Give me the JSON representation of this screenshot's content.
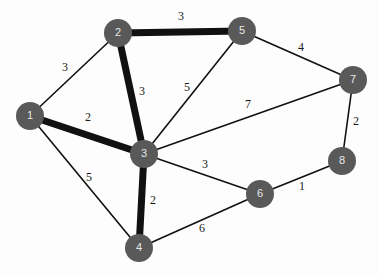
{
  "figure": {
    "background_color": "#fdfdfd",
    "width": 378,
    "height": 275
  },
  "style": {
    "node_fill": "#595959",
    "node_label_color": "#e8e8e8",
    "edge_color": "#111111",
    "weight_label_color": "#1a1a1a",
    "node_radius": 14
  },
  "chart_data": {
    "type": "diagram",
    "diagram_kind": "weighted-undirected-graph",
    "title": "",
    "nodes": [
      {
        "id": "1",
        "label": "1",
        "x": 30,
        "y": 116
      },
      {
        "id": "2",
        "label": "2",
        "x": 118,
        "y": 33
      },
      {
        "id": "3",
        "label": "3",
        "x": 144,
        "y": 154
      },
      {
        "id": "4",
        "label": "4",
        "x": 139,
        "y": 248
      },
      {
        "id": "5",
        "label": "5",
        "x": 242,
        "y": 31
      },
      {
        "id": "6",
        "label": "6",
        "x": 260,
        "y": 194
      },
      {
        "id": "7",
        "label": "7",
        "x": 353,
        "y": 80
      },
      {
        "id": "8",
        "label": "8",
        "x": 342,
        "y": 161
      }
    ],
    "edges": [
      {
        "source": "1",
        "target": "2",
        "weight": 3,
        "label": "3",
        "thick": false,
        "label_x": 65,
        "label_y": 68
      },
      {
        "source": "1",
        "target": "3",
        "weight": 2,
        "label": "2",
        "thick": true,
        "label_x": 88,
        "label_y": 118
      },
      {
        "source": "1",
        "target": "4",
        "weight": 5,
        "label": "5",
        "thick": false,
        "label_x": 89,
        "label_y": 178
      },
      {
        "source": "2",
        "target": "3",
        "weight": 3,
        "label": "3",
        "thick": true,
        "label_x": 142,
        "label_y": 92
      },
      {
        "source": "2",
        "target": "5",
        "weight": 3,
        "label": "3",
        "thick": true,
        "label_x": 181,
        "label_y": 17
      },
      {
        "source": "3",
        "target": "4",
        "weight": 2,
        "label": "2",
        "thick": true,
        "label_x": 153,
        "label_y": 201
      },
      {
        "source": "3",
        "target": "5",
        "weight": 5,
        "label": "5",
        "thick": false,
        "label_x": 187,
        "label_y": 88
      },
      {
        "source": "3",
        "target": "6",
        "weight": 3,
        "label": "3",
        "thick": false,
        "label_x": 205,
        "label_y": 165
      },
      {
        "source": "3",
        "target": "7",
        "weight": 7,
        "label": "7",
        "thick": false,
        "label_x": 248,
        "label_y": 105
      },
      {
        "source": "4",
        "target": "6",
        "weight": 6,
        "label": "6",
        "thick": false,
        "label_x": 202,
        "label_y": 229
      },
      {
        "source": "5",
        "target": "7",
        "weight": 4,
        "label": "4",
        "thick": false,
        "label_x": 301,
        "label_y": 48
      },
      {
        "source": "6",
        "target": "8",
        "weight": 1,
        "label": "1",
        "thick": false,
        "label_x": 302,
        "label_y": 187
      },
      {
        "source": "7",
        "target": "8",
        "weight": 2,
        "label": "2",
        "thick": false,
        "label_x": 356,
        "label_y": 122
      }
    ],
    "highlighted_path": [
      "2",
      "5"
    ],
    "thick_edges": [
      [
        "1",
        "3"
      ],
      [
        "2",
        "3"
      ],
      [
        "2",
        "5"
      ],
      [
        "3",
        "4"
      ]
    ],
    "xlabel": "",
    "ylabel": "",
    "legend": []
  }
}
